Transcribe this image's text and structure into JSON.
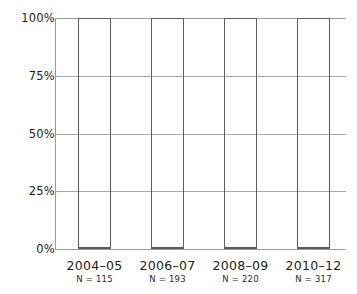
{
  "chart_data": {
    "type": "bar",
    "subtype": "stacked-percentage-100",
    "title": "",
    "xlabel": "",
    "ylabel": "",
    "ylim": [
      0,
      100
    ],
    "yticks": [
      0,
      25,
      50,
      75,
      100
    ],
    "ytick_labels": [
      "0%",
      "25%",
      "50%",
      "75%",
      "100%"
    ],
    "grid": true,
    "grid_axis": "y",
    "legend": false,
    "legend_position": "none",
    "categories": [
      "2004–05",
      "2006–07",
      "2008–09",
      "2010–12"
    ],
    "category_annotations": [
      "N = 115",
      "N = 193",
      "N = 220",
      "N = 317"
    ],
    "sample_sizes": [
      115,
      193,
      220,
      317
    ],
    "series": [
      {
        "name": "dark-gray-segment",
        "color": "#787878",
        "values": [
          2.5,
          5.0,
          7.0,
          10.0
        ]
      },
      {
        "name": "medium-gray-segment",
        "color": "#cdcdcd",
        "values": [
          5.0,
          9.0,
          10.5,
          11.5
        ]
      },
      {
        "name": "light-gray-segment",
        "color": "#eeeeee",
        "values": [
          92.5,
          86.0,
          82.5,
          78.5
        ]
      }
    ]
  },
  "axes": {
    "y_ticks": [
      {
        "label": "100%",
        "value": 100
      },
      {
        "label": "75%",
        "value": 75
      },
      {
        "label": "50%",
        "value": 50
      },
      {
        "label": "25%",
        "value": 25
      },
      {
        "label": "0%",
        "value": 0
      }
    ]
  },
  "colors": {
    "dark_segment": "#787878",
    "medium_segment": "#cdcdcd",
    "light_segment": "#eeeeee",
    "bar_outline": "#5d5d5d",
    "gridline": "#a8a8a8",
    "axis": "#9a9a9a",
    "text": "#1c1c1c",
    "background": "#ffffff"
  }
}
